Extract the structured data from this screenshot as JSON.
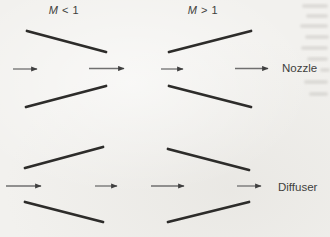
{
  "diagram": {
    "column_headers": [
      {
        "symbol": "M",
        "relation": "< 1"
      },
      {
        "symbol": "M",
        "relation": "> 1"
      }
    ],
    "row_labels": [
      "Nozzle",
      "Diffuser"
    ],
    "panels": [
      {
        "row": "Nozzle",
        "regime": "M < 1",
        "duct_shape": "converging",
        "flow_direction": "right",
        "inlet_arrow": "short",
        "outlet_arrow": "long"
      },
      {
        "row": "Nozzle",
        "regime": "M > 1",
        "duct_shape": "diverging",
        "flow_direction": "right",
        "inlet_arrow": "short",
        "outlet_arrow": "long"
      },
      {
        "row": "Diffuser",
        "regime": "M < 1",
        "duct_shape": "diverging",
        "flow_direction": "right",
        "inlet_arrow": "long",
        "outlet_arrow": "short"
      },
      {
        "row": "Diffuser",
        "regime": "M > 1",
        "duct_shape": "converging",
        "flow_direction": "right",
        "inlet_arrow": "long",
        "outlet_arrow": "short"
      }
    ],
    "colors": {
      "background": "#f2f1ee",
      "wall": "#2d2c2a",
      "arrow_shaft": "#6f6f6f",
      "arrow_head": "#3f3f3f",
      "text": "#403f3d"
    }
  }
}
